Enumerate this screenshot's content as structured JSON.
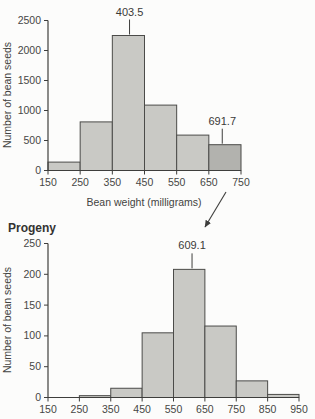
{
  "figure": {
    "description_visible_elements": "two stacked histograms connected by a diagonal arrow",
    "arrow": {
      "connects": [
        "parents bar 650-750 (below 691.7 label)",
        "progeny mean label 609.1"
      ]
    }
  },
  "colors": {
    "background": "#fcfcfb",
    "bar_fill": "#c9c9c5",
    "bar_fill_highlight": "#b2b2ae",
    "bar_stroke": "#4b4b49",
    "axis": "#3e3e3c",
    "text": "#3e3e3e"
  },
  "chart_data": [
    {
      "id": "parents",
      "type": "bar",
      "title": "Parents",
      "title_note": "cropped at top edge of screenshot, only bottom pixels visible",
      "xlabel": "Bean weight (milligrams)",
      "ylabel": "Number of bean seeds",
      "bin_edges": [
        150,
        250,
        350,
        450,
        550,
        650,
        750
      ],
      "values": [
        140,
        810,
        2250,
        1090,
        590,
        430
      ],
      "highlight_bin_index": 5,
      "x_ticks": [
        150,
        250,
        350,
        450,
        550,
        650,
        750
      ],
      "y_ticks": [
        0,
        500,
        1000,
        1500,
        2000,
        2500
      ],
      "xlim": [
        150,
        750
      ],
      "ylim": [
        0,
        2500
      ],
      "grid": false,
      "annotations": [
        {
          "label": "403.5",
          "x": 403.5
        },
        {
          "label": "691.7",
          "x": 691.7
        }
      ]
    },
    {
      "id": "progeny",
      "type": "bar",
      "title": "Progeny",
      "xlabel": "",
      "ylabel": "Number of bean seeds",
      "bin_edges": [
        150,
        250,
        350,
        450,
        550,
        650,
        750,
        850,
        950
      ],
      "values": [
        0,
        3,
        15,
        105,
        208,
        116,
        27,
        5
      ],
      "x_ticks": [
        150,
        250,
        350,
        450,
        550,
        650,
        750,
        850,
        950
      ],
      "y_ticks": [
        0,
        50,
        100,
        150,
        200,
        250
      ],
      "xlim": [
        150,
        950
      ],
      "ylim": [
        0,
        250
      ],
      "grid": false,
      "annotations": [
        {
          "label": "609.1",
          "x": 609.1
        }
      ]
    }
  ]
}
